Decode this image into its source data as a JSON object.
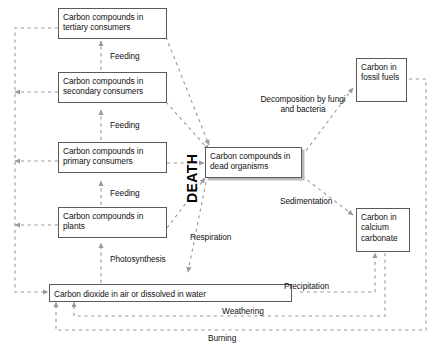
{
  "diagram": {
    "caption": "",
    "colors": {
      "arrow": "#9a9a9a",
      "box_border": "#5a5a5a",
      "text": "#111111",
      "background": "#ffffff",
      "shadow": "#b9b9b9"
    }
  },
  "nodes": {
    "tertiary": "Carbon compounds in tertiary consumers",
    "secondary": "Carbon compounds in secondary consumers",
    "primary": "Carbon compounds in primary consumers",
    "plants": "Carbon compounds in plants",
    "dead": "Carbon compounds in dead organisms",
    "fossil": "Carbon in fossil fuels",
    "calcium": "Carbon in calcium carbonate",
    "co2": "Carbon dioxide in air or dissolved in water"
  },
  "process_labels": {
    "feeding_upper": "Feeding",
    "feeding_mid": "Feeding",
    "feeding_lower": "Feeding",
    "death": "DEATH",
    "decomposition": "Decomposition by fungi and bacteria",
    "sedimentation": "Sedimentation",
    "respiration": "Respiration",
    "photosynthesis": "Photosynthesis",
    "precipitation": "Precipitation",
    "weathering": "Weathering",
    "burning": "Burning"
  }
}
